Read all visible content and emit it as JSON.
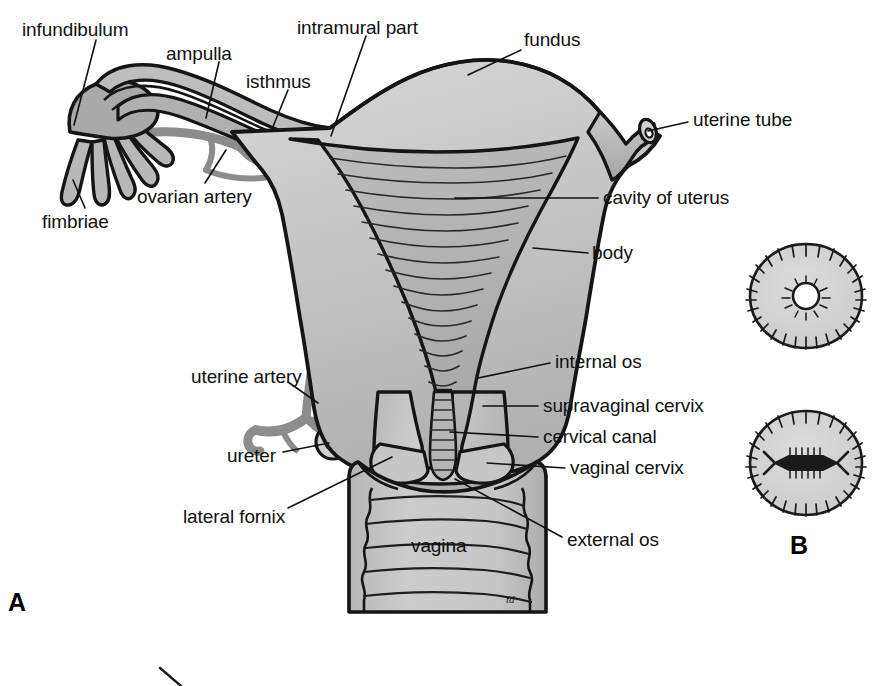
{
  "figure": {
    "background_color": "#ffffff",
    "ink_color": "#111111",
    "artery_color": "#8c8c8c",
    "organ_fill_light": "#d2d2d2",
    "organ_fill_mid": "#bcbcbc",
    "organ_fill_dark": "#a8a8a8",
    "artist_mark": "td"
  },
  "panels": [
    {
      "id": "panel-a",
      "letter": "A",
      "x": 8,
      "y": 590,
      "caption": "coronal section of uterus, uterine tubes and vagina"
    },
    {
      "id": "panel-b",
      "letter": "B",
      "x": 790,
      "y": 533,
      "caption": "external os of cervix: nulliparous and parous"
    }
  ],
  "labels": [
    {
      "id": "infundibulum",
      "text": "infundibulum",
      "x": 22,
      "y": 20,
      "anchor": "start",
      "leader": {
        "x1": 96,
        "y1": 40,
        "x2": 74,
        "y2": 125
      }
    },
    {
      "id": "ampulla",
      "text": "ampulla",
      "x": 166,
      "y": 44,
      "anchor": "start",
      "leader": {
        "x1": 219,
        "y1": 62,
        "x2": 206,
        "y2": 118
      }
    },
    {
      "id": "isthmus",
      "text": "isthmus",
      "x": 246,
      "y": 72,
      "anchor": "start",
      "leader": {
        "x1": 288,
        "y1": 90,
        "x2": 272,
        "y2": 129
      }
    },
    {
      "id": "intramural-part",
      "text": "intramural part",
      "x": 297,
      "y": 18,
      "anchor": "start",
      "leader": {
        "x1": 366,
        "y1": 36,
        "x2": 331,
        "y2": 136
      }
    },
    {
      "id": "fundus",
      "text": "fundus",
      "x": 524,
      "y": 30,
      "anchor": "start",
      "leader": {
        "x1": 521,
        "y1": 50,
        "x2": 468,
        "y2": 75
      }
    },
    {
      "id": "uterine-tube",
      "text": "uterine tube",
      "x": 693,
      "y": 110,
      "anchor": "start",
      "leader": {
        "x1": 688,
        "y1": 122,
        "x2": 648,
        "y2": 131
      }
    },
    {
      "id": "cavity-of-uterus",
      "text": "cavity of uterus",
      "x": 603,
      "y": 188,
      "anchor": "start",
      "leader": {
        "x1": 598,
        "y1": 198,
        "x2": 455,
        "y2": 198
      }
    },
    {
      "id": "body",
      "text": "body",
      "x": 592,
      "y": 243,
      "anchor": "start",
      "leader": {
        "x1": 588,
        "y1": 253,
        "x2": 533,
        "y2": 248
      }
    },
    {
      "id": "ovarian-artery",
      "text": "ovarian artery",
      "x": 137,
      "y": 187,
      "anchor": "start",
      "leader": {
        "x1": 205,
        "y1": 183,
        "x2": 226,
        "y2": 150
      }
    },
    {
      "id": "fimbriae",
      "text": "fimbriae",
      "x": 42,
      "y": 212,
      "anchor": "start",
      "leader": {
        "x1": 85,
        "y1": 208,
        "x2": 73,
        "y2": 180
      }
    },
    {
      "id": "internal-os",
      "text": "internal os",
      "x": 555,
      "y": 352,
      "anchor": "start",
      "leader": {
        "x1": 550,
        "y1": 363,
        "x2": 478,
        "y2": 378
      }
    },
    {
      "id": "supravaginal-cervix",
      "text": "supravaginal cervix",
      "x": 543,
      "y": 396,
      "anchor": "start",
      "leader": {
        "x1": 538,
        "y1": 406,
        "x2": 483,
        "y2": 406
      }
    },
    {
      "id": "cervical-canal",
      "text": "cervical canal",
      "x": 543,
      "y": 427,
      "anchor": "start",
      "leader": {
        "x1": 538,
        "y1": 437,
        "x2": 450,
        "y2": 432
      }
    },
    {
      "id": "vaginal-cervix",
      "text": "vaginal cervix",
      "x": 570,
      "y": 458,
      "anchor": "start",
      "leader": {
        "x1": 565,
        "y1": 468,
        "x2": 487,
        "y2": 463
      }
    },
    {
      "id": "uterine-artery",
      "text": "uterine artery",
      "x": 191,
      "y": 367,
      "anchor": "start",
      "leader": {
        "x1": 288,
        "y1": 382,
        "x2": 318,
        "y2": 403
      }
    },
    {
      "id": "ureter",
      "text": "ureter",
      "x": 227,
      "y": 446,
      "anchor": "start",
      "leader": {
        "x1": 283,
        "y1": 452,
        "x2": 329,
        "y2": 443
      }
    },
    {
      "id": "lateral-fornix",
      "text": "lateral fornix",
      "x": 183,
      "y": 507,
      "anchor": "start",
      "leader": {
        "x1": 288,
        "y1": 508,
        "x2": 392,
        "y2": 457
      }
    },
    {
      "id": "external-os",
      "text": "external os",
      "x": 567,
      "y": 530,
      "anchor": "start",
      "leader": {
        "x1": 562,
        "y1": 537,
        "x2": 455,
        "y2": 479
      }
    },
    {
      "id": "vagina",
      "text": "vagina",
      "x": 411,
      "y": 536,
      "anchor": "start",
      "leader": null
    }
  ],
  "cervix_os_views": [
    {
      "id": "nulliparous-os",
      "cx": 806,
      "cy": 296,
      "rx": 56,
      "ry": 52,
      "os_shape": "round",
      "os_radius": 13
    },
    {
      "id": "parous-os",
      "cx": 806,
      "cy": 463,
      "rx": 56,
      "ry": 52,
      "os_shape": "slit",
      "os_width": 62
    }
  ]
}
